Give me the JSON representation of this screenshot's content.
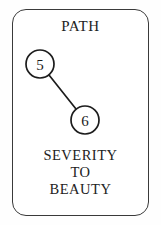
{
  "card": {
    "title": "PATH",
    "border_color": "#3a3a3a",
    "background_color": "#ffffff",
    "caption_lines": [
      "SEVERITY",
      "TO",
      "BEAUTY"
    ]
  },
  "graph": {
    "node_fill": "#ffffff",
    "node_stroke": "#1c1c1c",
    "edge_stroke": "#1c1c1c",
    "nodes": [
      {
        "id": "5",
        "label": "5",
        "cx": 40,
        "cy": 64,
        "r": 14
      },
      {
        "id": "6",
        "label": "6",
        "cx": 85,
        "cy": 120,
        "r": 14
      }
    ],
    "edges": [
      {
        "from": "5",
        "to": "6",
        "x1": 49,
        "y1": 75,
        "x2": 76,
        "y2": 109
      }
    ]
  }
}
